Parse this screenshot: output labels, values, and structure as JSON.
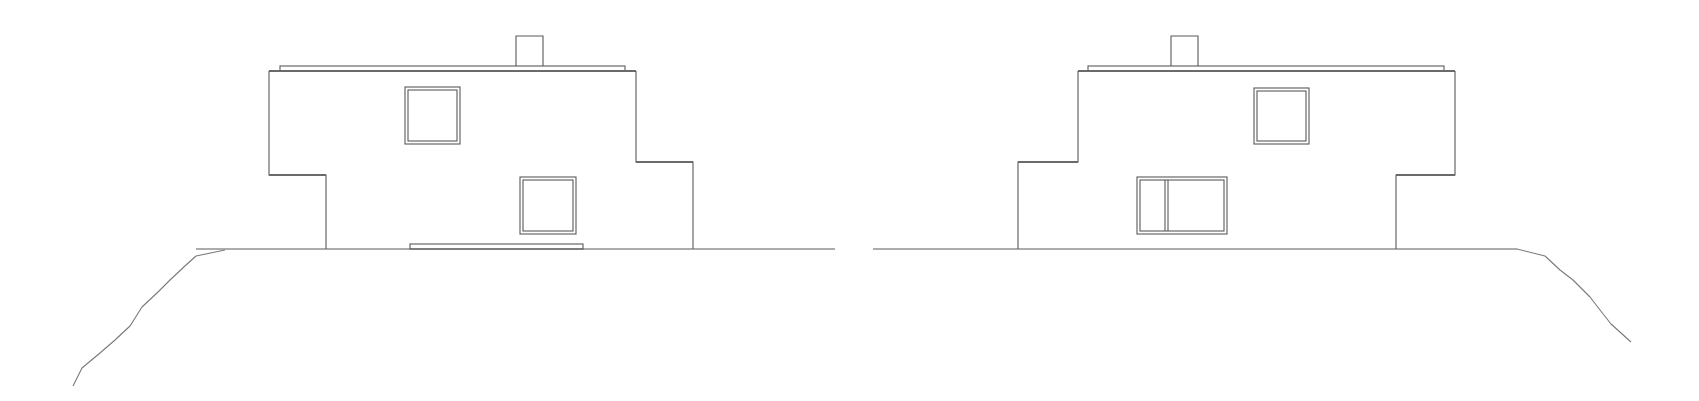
{
  "drawing": {
    "type": "architectural-elevations",
    "stroke_color": "#5a5a5a",
    "background": "#ffffff",
    "elevations": [
      {
        "name": "elevation-left",
        "ground": {
          "x1": 196,
          "x2": 835,
          "y": 249
        },
        "terrain": [
          [
            73,
            386
          ],
          [
            82,
            368
          ],
          [
            100,
            353
          ],
          [
            115,
            340
          ],
          [
            130,
            326
          ],
          [
            142,
            307
          ],
          [
            158,
            292
          ],
          [
            170,
            280
          ],
          [
            186,
            265
          ],
          [
            196,
            256
          ],
          [
            225,
            250
          ]
        ],
        "coping": {
          "x1": 280,
          "x2": 625,
          "y": 66
        },
        "roof": {
          "x1": 269,
          "x2": 636,
          "y": 71
        },
        "chimney": {
          "x": 516,
          "y": 36,
          "w": 27,
          "h": 30
        },
        "outline": [
          [
            269,
            71
          ],
          [
            269,
            175
          ],
          [
            326,
            175
          ],
          [
            326,
            249
          ]
        ],
        "outline_right": [
          [
            636,
            71
          ],
          [
            636,
            162
          ],
          [
            693,
            162
          ],
          [
            693,
            249
          ]
        ],
        "windows": [
          {
            "name": "upper-window",
            "x": 405,
            "y": 87,
            "w": 55,
            "h": 57,
            "mullion": null
          },
          {
            "name": "lower-window",
            "x": 520,
            "y": 177,
            "w": 56,
            "h": 57,
            "mullion": null
          }
        ],
        "step_slab": {
          "x": 410,
          "y": 244,
          "w": 173,
          "h": 5
        }
      },
      {
        "name": "elevation-right",
        "ground": {
          "x1": 873,
          "x2": 1517,
          "y": 249
        },
        "terrain": [
          [
            1517,
            249
          ],
          [
            1545,
            256
          ],
          [
            1560,
            270
          ],
          [
            1573,
            280
          ],
          [
            1590,
            297
          ],
          [
            1600,
            310
          ],
          [
            1611,
            324
          ],
          [
            1631,
            342
          ]
        ],
        "coping": {
          "x1": 1088,
          "x2": 1444,
          "y": 66
        },
        "roof": {
          "x1": 1078,
          "x2": 1455,
          "y": 71
        },
        "chimney": {
          "x": 1171,
          "y": 36,
          "w": 27,
          "h": 30
        },
        "outline": [
          [
            1078,
            71
          ],
          [
            1078,
            162
          ],
          [
            1018,
            162
          ],
          [
            1018,
            249
          ]
        ],
        "outline_right": [
          [
            1455,
            71
          ],
          [
            1455,
            175
          ],
          [
            1396,
            175
          ],
          [
            1396,
            249
          ]
        ],
        "windows": [
          {
            "name": "upper-window",
            "x": 1254,
            "y": 88,
            "w": 55,
            "h": 56,
            "mullion": null
          },
          {
            "name": "lower-window",
            "x": 1137,
            "y": 177,
            "w": 90,
            "h": 57,
            "mullion": 1165
          }
        ],
        "step_slab": null
      }
    ]
  }
}
